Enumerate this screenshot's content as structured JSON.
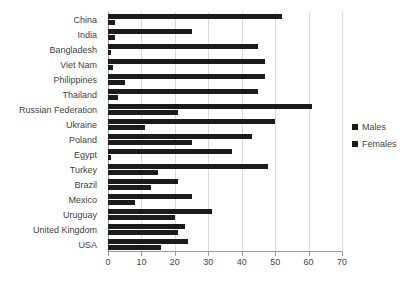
{
  "chart_data": {
    "type": "bar",
    "orientation": "horizontal",
    "title": "",
    "xlabel": "",
    "ylabel": "",
    "xlim": [
      0,
      70
    ],
    "xticks": [
      0,
      10,
      20,
      30,
      40,
      50,
      60,
      70
    ],
    "grid": true,
    "legend_position": "right",
    "categories": [
      "China",
      "India",
      "Bangladesh",
      "Viet Nam",
      "Philippines",
      "Thailand",
      "Russian Federation",
      "Ukraine",
      "Poland",
      "Egypt",
      "Turkey",
      "Brazil",
      "Mexico",
      "Uruguay",
      "United Kingdom",
      "USA"
    ],
    "series": [
      {
        "name": "Males",
        "color": "#1b1b1b",
        "values": [
          52,
          25,
          45,
          47,
          47,
          45,
          61,
          50,
          43,
          37,
          48,
          21,
          25,
          31,
          23,
          24
        ]
      },
      {
        "name": "Females",
        "color": "#1b1b1b",
        "values": [
          2,
          2,
          1,
          1.5,
          5,
          3,
          21,
          11,
          25,
          1,
          15,
          13,
          8,
          20,
          21,
          16
        ]
      }
    ]
  },
  "legend": {
    "items": [
      {
        "label": "Males",
        "color": "#1b1b1b"
      },
      {
        "label": "Females",
        "color": "#1b1b1b"
      }
    ]
  }
}
